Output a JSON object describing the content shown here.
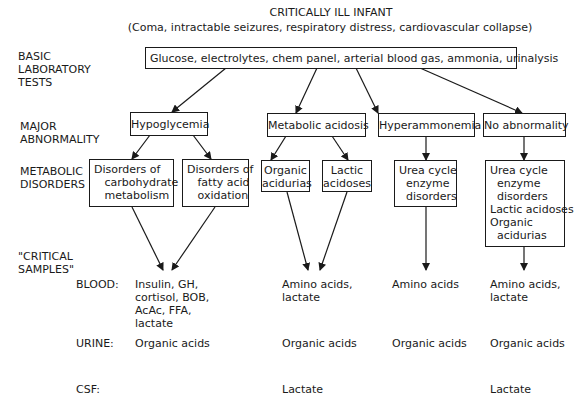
{
  "title": "CRITICALLY ILL INFANT",
  "subtitle": "(Coma, intractable seizures, respiratory distress, cardiovascular collapse)",
  "row_labels": {
    "basic_lab": "BASIC\nLABORATORY\nTESTS",
    "major_abnormality": "MAJOR\nABNORMALITY",
    "metabolic_disorders": "METABOLIC\nDISORDERS",
    "critical_samples": "\"CRITICAL\nSAMPLES\"",
    "blood": "BLOOD:",
    "urine": "URINE:",
    "csf": "CSF:"
  },
  "basic_tests": "Glucose, electrolytes, chem panel, arterial blood gas, ammonia, urinalysis",
  "abnormalities": [
    {
      "label": "Hypoglycemia"
    },
    {
      "label": "Metabolic acidosis"
    },
    {
      "label": "Hyperammonemia"
    },
    {
      "label": "No abnormality"
    }
  ],
  "disorders": {
    "carbohydrate": "Disorders of\n   carbohydrate\n   metabolism",
    "fatty_acid": "Disorders of\n   fatty acid\n   oxidation",
    "organic_acidurias": "Organic\nacidurias",
    "lactic_acidoses": "Lactic\nacidoses",
    "urea_cycle": "Urea cycle\n  enzyme\n  disorders",
    "no_abnormality_list": "Urea cycle\n  enzyme\n  disorders\nLactic acidoses\nOrganic\n  acidurias"
  },
  "samples": {
    "hypoglycemia": {
      "blood": "Insulin, GH,\ncortisol, BOB,\nAcAc, FFA,\nlactate",
      "urine": "Organic acids",
      "csf": ""
    },
    "metabolic_acidosis": {
      "blood": "Amino acids,\nlactate",
      "urine": "Organic acids",
      "csf": "Lactate"
    },
    "hyperammonemia": {
      "blood": "Amino acids",
      "urine": "Organic acids",
      "csf": ""
    },
    "no_abnormality": {
      "blood": "Amino acids,\nlactate",
      "urine": "Organic acids",
      "csf": "Lactate"
    }
  },
  "colors": {
    "ink": "#1a1a1a",
    "background": "#ffffff"
  }
}
